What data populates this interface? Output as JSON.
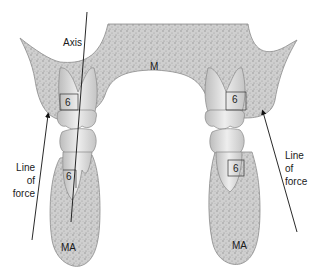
{
  "diagram": {
    "type": "dental cross-section",
    "labels": {
      "axis": "Axis",
      "maxilla": "M",
      "mandible_left": "MA",
      "mandible_right": "MA",
      "tooth_upper_left": "6",
      "tooth_lower_left": "6",
      "tooth_upper_right": "6",
      "tooth_lower_right": "6",
      "line_of_force_left": [
        "Line",
        "of",
        "force"
      ],
      "line_of_force_right": [
        "Line",
        "of",
        "force"
      ]
    },
    "colors": {
      "bone": "#c9c9c9",
      "bone_outline": "#8a8a8a",
      "tooth": "#dedede",
      "line": "#111111"
    }
  }
}
